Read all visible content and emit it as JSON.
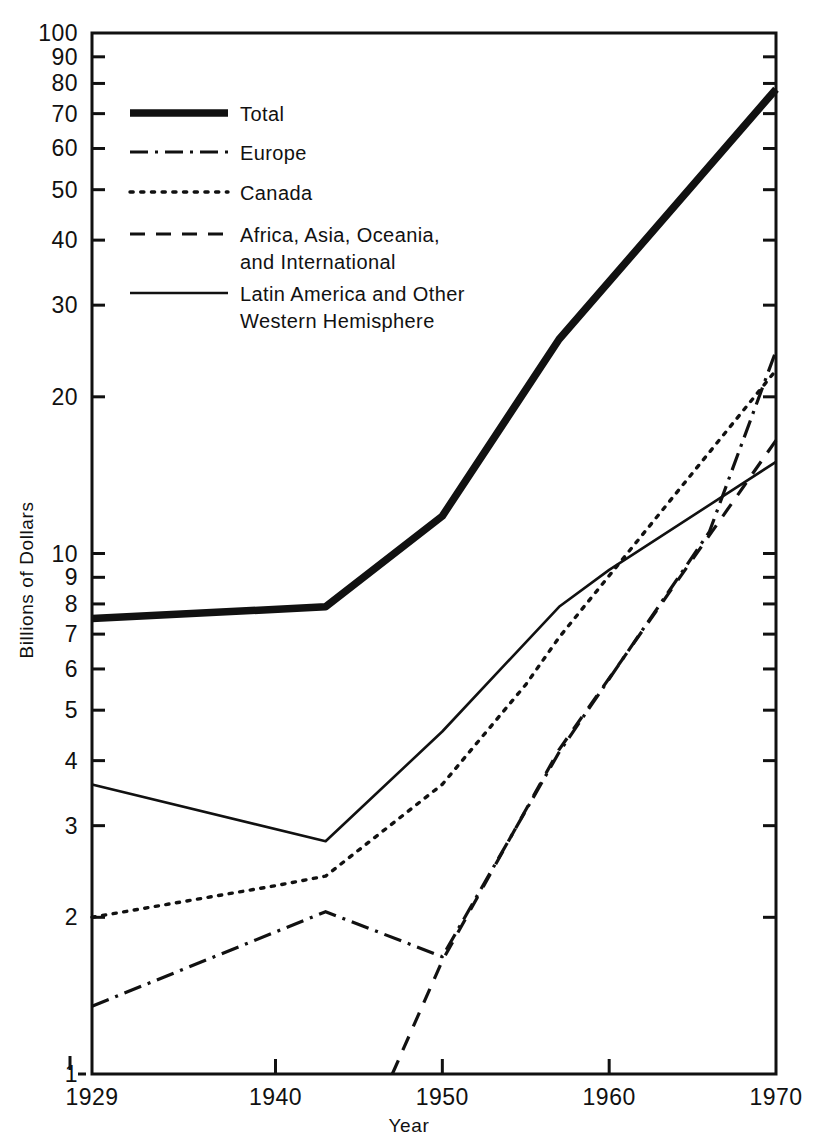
{
  "chart_data": {
    "type": "line",
    "title": "",
    "xlabel": "Year",
    "ylabel": "Billions of Dollars",
    "yscale": "log",
    "ylim": [
      1,
      100
    ],
    "xlim": [
      1929,
      1970
    ],
    "grid": false,
    "legend_position": "upper-left-inside",
    "y_ticks": [
      1,
      2,
      3,
      4,
      5,
      6,
      7,
      8,
      9,
      10,
      20,
      30,
      40,
      50,
      60,
      70,
      80,
      90,
      100
    ],
    "y_tick_labels": [
      "1",
      "2",
      "3",
      "4",
      "5",
      "6",
      "7",
      "8",
      "9",
      "10",
      "20",
      "30",
      "40",
      "50",
      "60",
      "70",
      "80",
      "90",
      "100"
    ],
    "x_ticks": [
      1929,
      1940,
      1950,
      1960,
      1970
    ],
    "x_tick_labels": [
      "1929",
      "1940",
      "1950",
      "1960",
      "1970"
    ],
    "series": [
      {
        "name": "Total",
        "style": "thick-solid",
        "x": [
          1929,
          1943,
          1950,
          1957,
          1970
        ],
        "values": [
          7.5,
          7.9,
          11.8,
          25.8,
          78.0
        ]
      },
      {
        "name": "Europe",
        "style": "dash-dot",
        "x": [
          1929,
          1943,
          1950,
          1957,
          1966,
          1970
        ],
        "values": [
          1.35,
          2.05,
          1.68,
          4.15,
          11.0,
          24.5
        ]
      },
      {
        "name": "Canada",
        "style": "dotted",
        "x": [
          1929,
          1940,
          1943,
          1950,
          1955,
          1957,
          1970
        ],
        "values": [
          2.0,
          2.3,
          2.4,
          3.6,
          5.6,
          6.9,
          22.5
        ]
      },
      {
        "name": "Africa, Asia, Oceania, and International",
        "style": "dashed",
        "x": [
          1947,
          1950,
          1957,
          1970
        ],
        "values": [
          1.0,
          1.65,
          4.2,
          16.5
        ]
      },
      {
        "name": "Latin America and Other Western Hemisphere",
        "style": "thin-solid",
        "x": [
          1929,
          1943,
          1950,
          1957,
          1960,
          1970
        ],
        "values": [
          3.6,
          2.8,
          4.55,
          7.9,
          9.3,
          15.0
        ]
      }
    ]
  },
  "legend": {
    "items": [
      {
        "label": "Total",
        "style": "thick-solid"
      },
      {
        "label": "Europe",
        "style": "dash-dot"
      },
      {
        "label": "Canada",
        "style": "dotted"
      },
      {
        "label": "Africa, Asia, Oceania,",
        "label2": "and International",
        "style": "dashed"
      },
      {
        "label": "Latin America and Other",
        "label2": "Western Hemisphere",
        "style": "thin-solid"
      }
    ]
  },
  "axes": {
    "x_title": "Year",
    "y_title": "Billions of Dollars"
  },
  "colors": {
    "ink": "#111111",
    "background": "#ffffff"
  }
}
